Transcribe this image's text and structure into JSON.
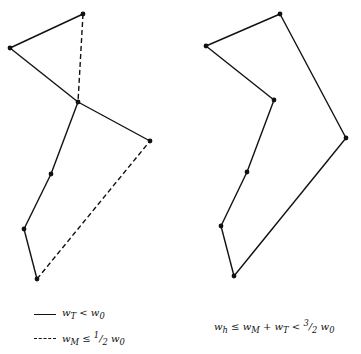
{
  "figure": {
    "left": {
      "vertices": [
        [
          83,
          14
        ],
        [
          10,
          48
        ],
        [
          78,
          102
        ],
        [
          150,
          141
        ],
        [
          51,
          174
        ],
        [
          24,
          229
        ],
        [
          37,
          279
        ]
      ],
      "solid_edges": [
        [
          0,
          1
        ],
        [
          1,
          2
        ],
        [
          2,
          3
        ],
        [
          2,
          4
        ],
        [
          4,
          5
        ],
        [
          5,
          6
        ]
      ],
      "dashed_edges": [
        [
          0,
          2
        ],
        [
          6,
          3
        ]
      ]
    },
    "right": {
      "vertices": [
        [
          280,
          14
        ],
        [
          206,
          46
        ],
        [
          274,
          100
        ],
        [
          346,
          138
        ],
        [
          247,
          172
        ],
        [
          221,
          226
        ],
        [
          234,
          276
        ]
      ],
      "solid_edges": [
        [
          0,
          1
        ],
        [
          1,
          2
        ],
        [
          2,
          4
        ],
        [
          4,
          5
        ],
        [
          5,
          6
        ],
        [
          6,
          3
        ],
        [
          3,
          0
        ]
      ],
      "dashed_edges": []
    }
  },
  "legend": {
    "solid_label": "w_T < w_0",
    "dashed_label": "w_M ≤ ½ w_0"
  },
  "caption_right": "w_h ≤ w_M + w_T < 3/2 w_0",
  "colors": {
    "stroke": "#111111",
    "background": "#ffffff"
  }
}
